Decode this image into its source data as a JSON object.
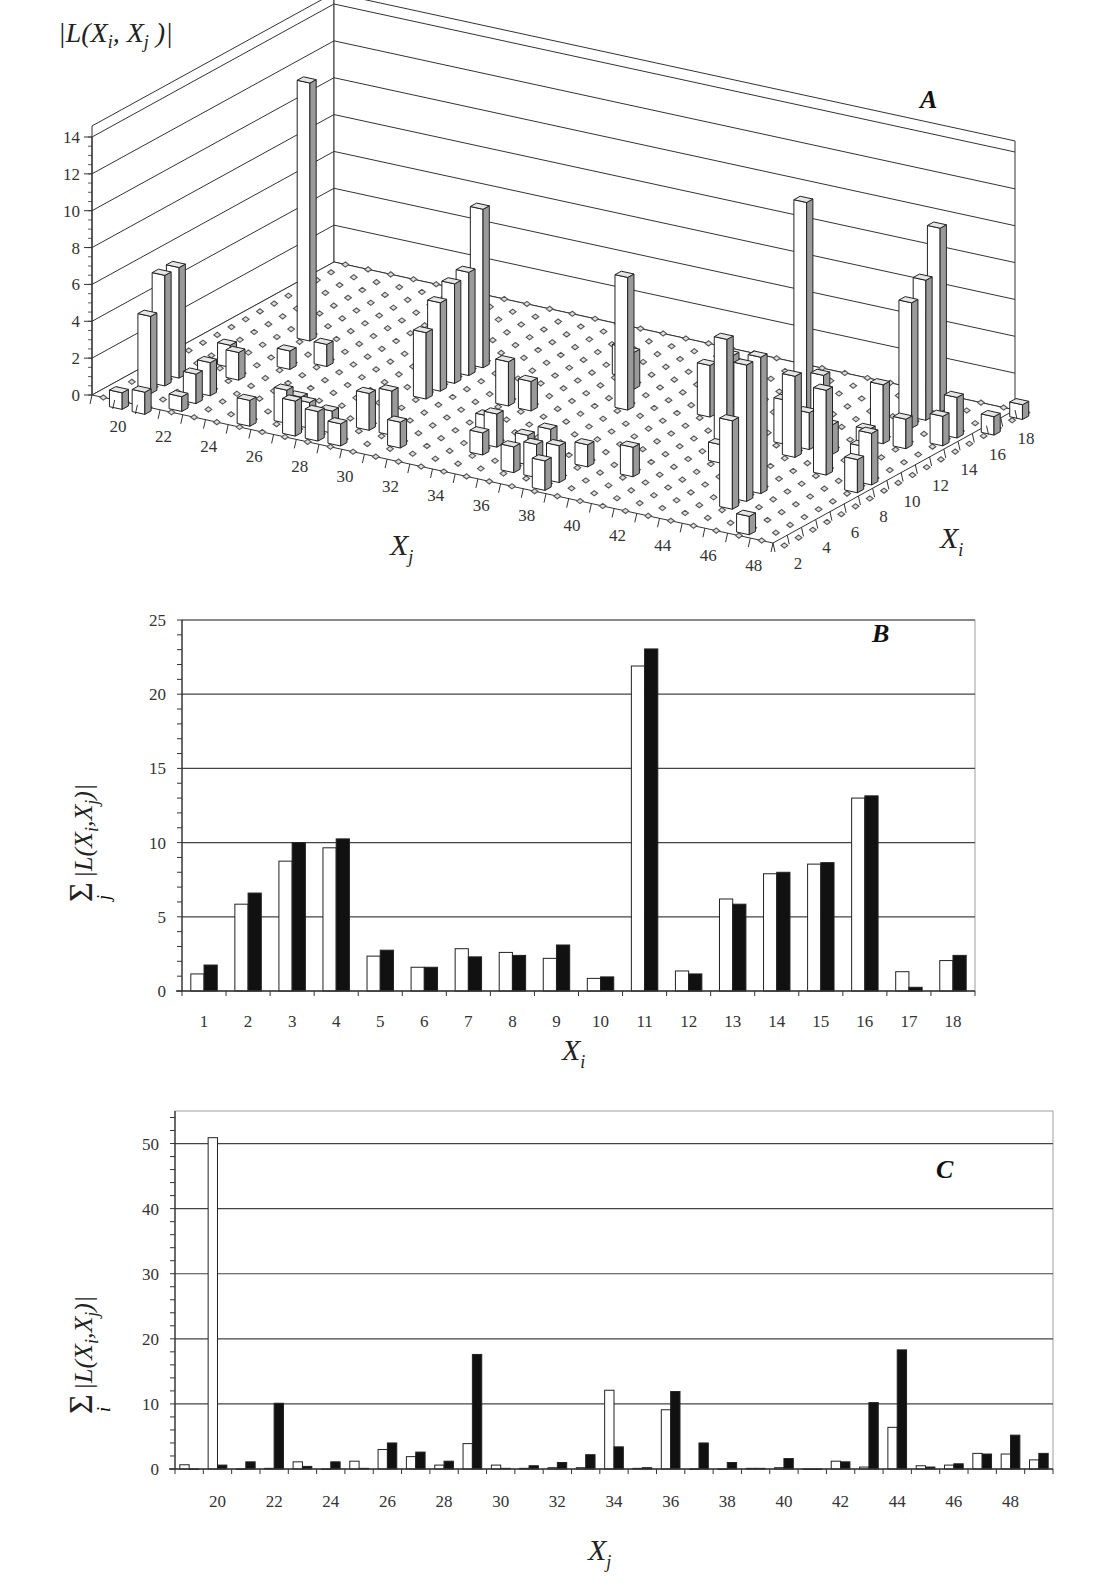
{
  "chart_data": [
    {
      "id": "A",
      "type": "bar3d",
      "panel_label": "A",
      "title": "",
      "zlabel": "|L(X_i, X_j)|",
      "xlabel": "X_j",
      "ylabel": "X_i",
      "z_ticks": [
        0,
        2,
        4,
        6,
        8,
        10,
        12,
        14
      ],
      "zlim": [
        0,
        14
      ],
      "xj_ticks": [
        20,
        22,
        24,
        26,
        28,
        30,
        32,
        34,
        36,
        38,
        40,
        42,
        44,
        46,
        48
      ],
      "xi_ticks": [
        2,
        4,
        6,
        8,
        10,
        12,
        14,
        16,
        18
      ],
      "xj_range": [
        19,
        49
      ],
      "xi_range": [
        1,
        18
      ],
      "bars": [
        {
          "j": 20,
          "i": 1,
          "value": 0.9
        },
        {
          "j": 20,
          "i": 3,
          "value": 4.2
        },
        {
          "j": 20,
          "i": 4,
          "value": 6.0
        },
        {
          "j": 20,
          "i": 5,
          "value": 6.0
        },
        {
          "j": 21,
          "i": 1,
          "value": 1.2
        },
        {
          "j": 22,
          "i": 2,
          "value": 0.8
        },
        {
          "j": 22,
          "i": 3,
          "value": 1.6
        },
        {
          "j": 22,
          "i": 4,
          "value": 1.8
        },
        {
          "j": 22,
          "i": 6,
          "value": 1.5
        },
        {
          "j": 21,
          "i": 7,
          "value": 1.2
        },
        {
          "j": 22,
          "i": 11,
          "value": 14.0
        },
        {
          "j": 23,
          "i": 8,
          "value": 1.0
        },
        {
          "j": 24,
          "i": 9,
          "value": 1.2
        },
        {
          "j": 25,
          "i": 2,
          "value": 1.4
        },
        {
          "j": 26,
          "i": 3,
          "value": 1.8
        },
        {
          "j": 26,
          "i": 4,
          "value": 1.0
        },
        {
          "j": 27,
          "i": 2,
          "value": 1.9
        },
        {
          "j": 27,
          "i": 3,
          "value": 1.4
        },
        {
          "j": 28,
          "i": 2,
          "value": 1.6
        },
        {
          "j": 28,
          "i": 3,
          "value": 1.2
        },
        {
          "j": 29,
          "i": 2,
          "value": 1.2
        },
        {
          "j": 29,
          "i": 8,
          "value": 3.6
        },
        {
          "j": 29,
          "i": 9,
          "value": 4.8
        },
        {
          "j": 29,
          "i": 10,
          "value": 5.4
        },
        {
          "j": 29,
          "i": 11,
          "value": 5.6
        },
        {
          "j": 29,
          "i": 12,
          "value": 8.6
        },
        {
          "j": 29,
          "i": 4,
          "value": 2.0
        },
        {
          "j": 30,
          "i": 4,
          "value": 2.4
        },
        {
          "j": 31,
          "i": 3,
          "value": 1.4
        },
        {
          "j": 32,
          "i": 9,
          "value": 2.4
        },
        {
          "j": 33,
          "i": 9,
          "value": 1.6
        },
        {
          "j": 33,
          "i": 6,
          "value": 1.0
        },
        {
          "j": 34,
          "i": 4,
          "value": 1.2
        },
        {
          "j": 34,
          "i": 5,
          "value": 1.8
        },
        {
          "j": 34,
          "i": 14,
          "value": 1.6
        },
        {
          "j": 35,
          "i": 13,
          "value": 2.0
        },
        {
          "j": 36,
          "i": 11,
          "value": 7.2
        },
        {
          "j": 36,
          "i": 3,
          "value": 1.4
        },
        {
          "j": 36,
          "i": 4,
          "value": 1.6
        },
        {
          "j": 37,
          "i": 4,
          "value": 2.2
        },
        {
          "j": 37,
          "i": 3,
          "value": 1.8
        },
        {
          "j": 38,
          "i": 2,
          "value": 1.6
        },
        {
          "j": 38,
          "i": 3,
          "value": 2.0
        },
        {
          "j": 38,
          "i": 5,
          "value": 1.2
        },
        {
          "j": 39,
          "i": 12,
          "value": 2.8
        },
        {
          "j": 40,
          "i": 12,
          "value": 3.6
        },
        {
          "j": 40,
          "i": 5,
          "value": 1.6
        },
        {
          "j": 41,
          "i": 10,
          "value": 5.6
        },
        {
          "j": 41,
          "i": 11,
          "value": 1.4
        },
        {
          "j": 42,
          "i": 14,
          "value": 11.6
        },
        {
          "j": 42,
          "i": 8,
          "value": 1.0
        },
        {
          "j": 43,
          "i": 11,
          "value": 2.4
        },
        {
          "j": 44,
          "i": 12,
          "value": 3.6
        },
        {
          "j": 44,
          "i": 10,
          "value": 4.4
        },
        {
          "j": 44,
          "i": 11,
          "value": 2.0
        },
        {
          "j": 45,
          "i": 4,
          "value": 4.8
        },
        {
          "j": 45,
          "i": 5,
          "value": 7.4
        },
        {
          "j": 45,
          "i": 6,
          "value": 7.4
        },
        {
          "j": 45,
          "i": 11,
          "value": 1.6
        },
        {
          "j": 46,
          "i": 13,
          "value": 3.2
        },
        {
          "j": 46,
          "i": 15,
          "value": 6.8
        },
        {
          "j": 46,
          "i": 16,
          "value": 7.6
        },
        {
          "j": 46,
          "i": 17,
          "value": 10.0
        },
        {
          "j": 46,
          "i": 9,
          "value": 4.6
        },
        {
          "j": 46,
          "i": 12,
          "value": 1.2
        },
        {
          "j": 47,
          "i": 10,
          "value": 1.4
        },
        {
          "j": 47,
          "i": 13,
          "value": 1.6
        },
        {
          "j": 47,
          "i": 2,
          "value": 1.0
        },
        {
          "j": 48,
          "i": 8,
          "value": 1.8
        },
        {
          "j": 48,
          "i": 9,
          "value": 2.8
        },
        {
          "j": 48,
          "i": 14,
          "value": 1.6
        },
        {
          "j": 48,
          "i": 15,
          "value": 2.2
        },
        {
          "j": 49,
          "i": 16,
          "value": 1.0
        },
        {
          "j": 49,
          "i": 18,
          "value": 0.8
        }
      ]
    },
    {
      "id": "B",
      "type": "bar",
      "panel_label": "B",
      "title": "",
      "xlabel": "X_i",
      "ylabel": "Σ_j |L(X_i, X_j)|",
      "ylim": [
        0,
        25
      ],
      "y_ticks": [
        0,
        5,
        10,
        15,
        20,
        25
      ],
      "grid": true,
      "legend": "none",
      "categories": [
        "1",
        "2",
        "3",
        "4",
        "5",
        "6",
        "7",
        "8",
        "9",
        "10",
        "11",
        "12",
        "13",
        "14",
        "15",
        "16",
        "17",
        "18"
      ],
      "series": [
        {
          "name": "white",
          "color": "#ffffff",
          "values": [
            1.15,
            5.85,
            8.75,
            9.65,
            2.35,
            1.6,
            2.85,
            2.6,
            2.2,
            0.85,
            21.9,
            1.35,
            6.2,
            7.9,
            8.55,
            13.0,
            1.3,
            2.05
          ]
        },
        {
          "name": "black",
          "color": "#111111",
          "values": [
            1.75,
            6.6,
            10.0,
            10.25,
            2.75,
            1.6,
            2.3,
            2.4,
            3.1,
            0.95,
            23.05,
            1.15,
            5.85,
            8.0,
            8.65,
            13.15,
            0.25,
            2.4
          ]
        }
      ]
    },
    {
      "id": "C",
      "type": "bar",
      "panel_label": "C",
      "title": "",
      "xlabel": "X_j",
      "ylabel": "Σ_i |L(X_i, X_j)|",
      "ylim": [
        0,
        55
      ],
      "y_ticks": [
        0,
        10,
        20,
        30,
        40,
        50
      ],
      "x_tick_labels": [
        "20",
        "22",
        "24",
        "26",
        "28",
        "30",
        "32",
        "34",
        "36",
        "38",
        "40",
        "42",
        "44",
        "46",
        "48"
      ],
      "grid": true,
      "legend": "none",
      "categories": [
        "19",
        "20",
        "21",
        "22",
        "23",
        "24",
        "25",
        "26",
        "27",
        "28",
        "29",
        "30",
        "31",
        "32",
        "33",
        "34",
        "35",
        "36",
        "37",
        "38",
        "39",
        "40",
        "41",
        "42",
        "43",
        "44",
        "45",
        "46",
        "47",
        "48",
        "49"
      ],
      "series": [
        {
          "name": "white",
          "color": "#ffffff",
          "values": [
            0.65,
            50.9,
            0.0,
            0.1,
            1.1,
            0.0,
            1.2,
            3.0,
            1.9,
            0.6,
            3.9,
            0.6,
            0.1,
            0.2,
            0.2,
            12.1,
            0.1,
            9.1,
            0.0,
            0.0,
            0.1,
            0.2,
            0.0,
            1.2,
            0.3,
            6.4,
            0.5,
            0.6,
            2.4,
            2.3,
            1.4
          ]
        },
        {
          "name": "black",
          "color": "#111111",
          "values": [
            0.0,
            0.6,
            1.1,
            10.1,
            0.4,
            1.1,
            0.1,
            4.0,
            2.6,
            1.2,
            17.6,
            0.1,
            0.5,
            1.0,
            2.2,
            3.4,
            0.2,
            11.9,
            4.0,
            1.0,
            0.1,
            1.6,
            0.0,
            1.1,
            10.2,
            18.3,
            0.3,
            0.8,
            2.3,
            5.2,
            2.4
          ]
        }
      ]
    }
  ],
  "labels": {
    "A": {
      "letter": "A",
      "z_main": "|L(X",
      "z_sub_i": "i",
      "z_mid": ", X",
      "z_sub_j": "j",
      "z_end": " )|",
      "xj_main": "X",
      "xj_sub": "j",
      "xi_main": "X",
      "xi_sub": "i"
    },
    "B": {
      "letter": "B",
      "y_sigma": "Σ",
      "y_sigma_sub": "j",
      "y_text": "|L(X",
      "y_sub_i": "i",
      "y_mid": ",X",
      "y_sub_j": "j",
      "y_end": ")|",
      "x_main": "X",
      "x_sub": "i"
    },
    "C": {
      "letter": "C",
      "y_sigma": "Σ",
      "y_sigma_sub": "i",
      "y_text": "|L(X",
      "y_sub_i": "i",
      "y_mid": ",X",
      "y_sub_j": "j",
      "y_end": ")|",
      "x_main": "X",
      "x_sub": "j"
    }
  },
  "colors": {
    "axis": "#333333",
    "grid": "#444444",
    "bar_white": "#ffffff",
    "bar_black": "#111111",
    "bar3d_front": "#ffffff",
    "bar3d_side": "#9a9a9a",
    "floor_marker": "#555555"
  }
}
